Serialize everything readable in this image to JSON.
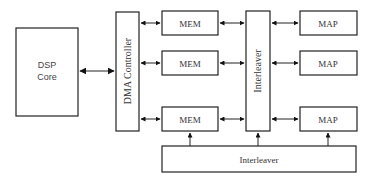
{
  "diagram": {
    "type": "block-diagram",
    "nodes": {
      "dsp_core": {
        "label_line1": "DSP",
        "label_line2": "Core"
      },
      "dma_controller": {
        "label": "DMA Controller"
      },
      "mem": [
        {
          "label": "MEM"
        },
        {
          "label": "MEM"
        },
        {
          "label": "MEM"
        }
      ],
      "interleaver_vertical": {
        "label": "Interleaver"
      },
      "map": [
        {
          "label": "MAP"
        },
        {
          "label": "MAP"
        },
        {
          "label": "MAP"
        }
      ],
      "interleaver_bottom": {
        "label": "Interleaver"
      }
    },
    "edges": [
      {
        "from": "DSP Core",
        "to": "DMA Controller",
        "type": "bidirectional"
      },
      {
        "from": "DMA Controller",
        "to": "MEM 1",
        "type": "bidirectional"
      },
      {
        "from": "DMA Controller",
        "to": "MEM 2",
        "type": "bidirectional"
      },
      {
        "from": "DMA Controller",
        "to": "MEM 3",
        "type": "bidirectional"
      },
      {
        "from": "MEM 1",
        "to": "Interleaver",
        "type": "bidirectional"
      },
      {
        "from": "MEM 2",
        "to": "Interleaver",
        "type": "bidirectional"
      },
      {
        "from": "MEM 3",
        "to": "Interleaver",
        "type": "bidirectional"
      },
      {
        "from": "Interleaver",
        "to": "MAP 1",
        "type": "bidirectional"
      },
      {
        "from": "Interleaver",
        "to": "MAP 2",
        "type": "bidirectional"
      },
      {
        "from": "Interleaver",
        "to": "MAP 3",
        "type": "bidirectional"
      },
      {
        "from": "Interleaver (bottom)",
        "to": "MEM 3",
        "type": "directed"
      },
      {
        "from": "Interleaver (bottom)",
        "to": "Interleaver",
        "type": "directed"
      },
      {
        "from": "Interleaver (bottom)",
        "to": "MAP 3",
        "type": "directed"
      }
    ],
    "colors": {
      "stroke": "#222222",
      "background": "#ffffff",
      "text": "#333333"
    }
  }
}
